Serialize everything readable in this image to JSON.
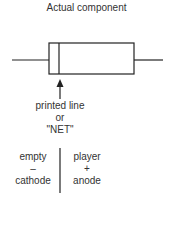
{
  "title": "Actual component",
  "marking_label": {
    "line1": "printed line",
    "line2": "or",
    "line3": "\"NET\""
  },
  "left_side": {
    "state": "empty",
    "polarity": "–",
    "terminal": "cathode"
  },
  "right_side": {
    "state": "player",
    "polarity": "+",
    "terminal": "anode"
  },
  "colors": {
    "line": "#222222",
    "text": "#333333"
  }
}
